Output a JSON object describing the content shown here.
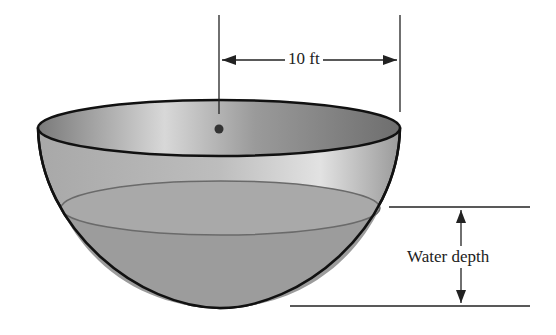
{
  "diagram": {
    "labels": {
      "radius": "10 ft",
      "depth": "Water depth"
    },
    "shapes": [
      "hemisphere-bowl",
      "water-surface-ellipse",
      "center-point",
      "radius-dimension-arrow",
      "depth-dimension-arrow"
    ],
    "colors": {
      "bowl_outline": "#111111",
      "bowl_inner": "#8a8a8a",
      "water": "#9c9c9c",
      "background": "#ffffff"
    }
  }
}
